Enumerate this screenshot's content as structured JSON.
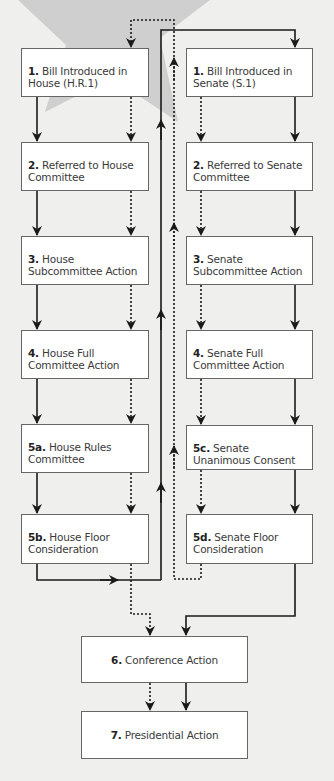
{
  "diagram": {
    "type": "flowchart",
    "colors": {
      "background": "#efefed",
      "box_fill": "#ffffff",
      "box_border": "#666666",
      "line": "#1a1a1a",
      "star": "#c9c9c9",
      "text": "#3a3a3a"
    },
    "house": [
      {
        "num": "1.",
        "text": "Bill Introduced in House (H.R.1)"
      },
      {
        "num": "2.",
        "text": "Referred to House Committee"
      },
      {
        "num": "3.",
        "text": "House Subcommittee Action"
      },
      {
        "num": "4.",
        "text": "House Full Committee Action"
      },
      {
        "num": "5a.",
        "text": "House Rules Committee"
      },
      {
        "num": "5b.",
        "text": "House Floor Consideration"
      }
    ],
    "senate": [
      {
        "num": "1.",
        "text": "Bill Introduced in Senate (S.1)"
      },
      {
        "num": "2.",
        "text": "Referred to Senate Committee"
      },
      {
        "num": "3.",
        "text": "Senate Subcommittee Action"
      },
      {
        "num": "4.",
        "text": "Senate Full Committee Action"
      },
      {
        "num": "5c.",
        "text": "Senate Unanimous Consent"
      },
      {
        "num": "5d.",
        "text": "Senate Floor Consideration"
      }
    ],
    "final": [
      {
        "num": "6.",
        "text": "Conference Action"
      },
      {
        "num": "7.",
        "text": "Presidential Action"
      }
    ],
    "legend_lines": {
      "solid": "House bill path (H.R.1)",
      "dotted": "Senate bill path (S.1)"
    }
  }
}
